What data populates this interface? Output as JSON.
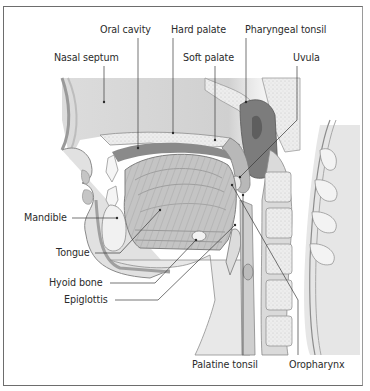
{
  "figure": {
    "colors": {
      "frame": "#6d6d6d",
      "tissue_light": "#e9e9e9",
      "tissue_mid": "#c8c8c8",
      "tissue_dark": "#8c8c8c",
      "bone": "#f4f4f4",
      "leader_line": "#3a3a3a",
      "text": "#2b2b2b"
    }
  },
  "labels": {
    "oral_cavity": "Oral cavity",
    "hard_palate": "Hard palate",
    "pharyngeal_tonsil": "Pharyngeal tonsil",
    "nasal_septum": "Nasal septum",
    "soft_palate": "Soft palate",
    "uvula": "Uvula",
    "mandible": "Mandible",
    "tongue": "Tongue",
    "hyoid_bone": "Hyoid bone",
    "epiglottis": "Epiglottis",
    "palatine_tonsil": "Palatine tonsil",
    "oropharynx": "Oropharynx"
  }
}
